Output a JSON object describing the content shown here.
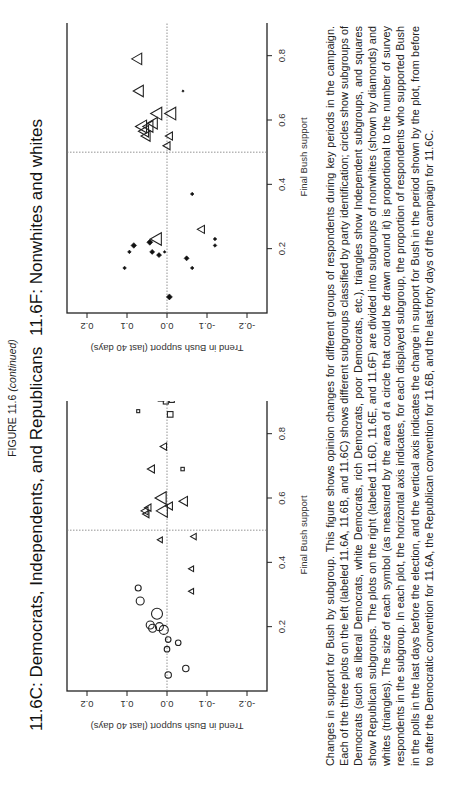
{
  "figure": {
    "label": "FIGURE 11.6",
    "label_suffix": "(continued)"
  },
  "panels": {
    "left": {
      "title": "11.6C:  Democrats, Independents, and Republicans"
    },
    "right": {
      "title": "11.6F:  Nonwhites and whites"
    }
  },
  "axes": {
    "xlabel": "Final Bush support",
    "ylabel": "Trend in Bush support (last 40 days)",
    "x_ticks": [
      "0.2",
      "0.4",
      "0.6",
      "0.8"
    ],
    "y_ticks": [
      "-0.2",
      "-0.1",
      "0.0",
      "0.1",
      "0.2"
    ]
  },
  "caption": "Changes in support for Bush by subgroup. This figure shows opinion changes for different groups of respondents during key periods in the campaign. Each of the three plots on the left (labeled 11.6A, 11.6B, and 11.6C) shows different subgroups classified by party identification; circles show subgroups of Democrats (such as liberal Democrats, white Democrats, rich Democrats, poor Democrats, etc.), triangles show Independent subgroups, and squares show Republican subgroups. The plots on the right (labeled 11.6D, 11.6E, and 11.6F) are divided into subgroups of nonwhites (shown by diamonds) and whites (triangles). The size of each symbol (as measured by the area of a circle that could be drawn around it) is proportional to the number of survey respondents in the subgroup. In each plot, the horizontal axis indicates, for each displayed subgroup, the proportion of respondents who supported Bush in the polls in the last days before the election, and the vertical axis indicates the change in support for Bush in the period shown by the plot, from before to after the Democratic convention for 11.6A, the Republican convention for 11.6B, and the last forty days of the campaign for 11.6C.",
  "chart_data": [
    {
      "type": "scatter",
      "title": "11.6C: Democrats, Independents, and Republicans",
      "xlabel": "Final Bush support",
      "ylabel": "Trend in Bush support (last 40 days)",
      "xlim": [
        0.0,
        0.97
      ],
      "ylim": [
        -0.25,
        0.25
      ],
      "x_ticks": [
        0.2,
        0.4,
        0.6,
        0.8
      ],
      "y_ticks": [
        -0.2,
        -0.1,
        0.0,
        0.1,
        0.2
      ],
      "reference_lines": {
        "x": 0.5,
        "y": 0.0
      },
      "grid": false,
      "series": [
        {
          "name": "Democrats",
          "marker": "circle",
          "points": [
            {
              "x": 0.32,
              "y": 0.072,
              "s": 3
            },
            {
              "x": 0.28,
              "y": 0.067,
              "s": 4
            },
            {
              "x": 0.24,
              "y": 0.025,
              "s": 5.5
            },
            {
              "x": 0.205,
              "y": 0.042,
              "s": 4
            },
            {
              "x": 0.195,
              "y": 0.036,
              "s": 4
            },
            {
              "x": 0.2,
              "y": 0.019,
              "s": 4
            },
            {
              "x": 0.19,
              "y": 0.008,
              "s": 4.5
            },
            {
              "x": 0.16,
              "y": -0.003,
              "s": 2.8
            },
            {
              "x": 0.15,
              "y": -0.028,
              "s": 2.8
            },
            {
              "x": 0.13,
              "y": 0.0,
              "s": 2.8
            },
            {
              "x": 0.05,
              "y": -0.003,
              "s": 3.2
            },
            {
              "x": 0.07,
              "y": -0.047,
              "s": 3.2
            }
          ]
        },
        {
          "name": "Independents",
          "marker": "triangle",
          "points": [
            {
              "x": 0.76,
              "y": 0.008,
              "s": 3.2
            },
            {
              "x": 0.69,
              "y": 0.039,
              "s": 3.5
            },
            {
              "x": 0.6,
              "y": 0.014,
              "s": 5.5
            },
            {
              "x": 0.59,
              "y": -0.042,
              "s": 4.2
            },
            {
              "x": 0.575,
              "y": -0.006,
              "s": 3.5
            },
            {
              "x": 0.56,
              "y": 0.011,
              "s": 5.5
            },
            {
              "x": 0.57,
              "y": 0.047,
              "s": 3.2
            },
            {
              "x": 0.56,
              "y": 0.055,
              "s": 3.5
            },
            {
              "x": 0.55,
              "y": 0.052,
              "s": 3.2
            },
            {
              "x": 0.47,
              "y": 0.017,
              "s": 2.5
            },
            {
              "x": 0.48,
              "y": -0.067,
              "s": 2.8
            },
            {
              "x": 0.38,
              "y": -0.061,
              "s": 2.5
            },
            {
              "x": 0.31,
              "y": -0.061,
              "s": 2.5
            }
          ]
        },
        {
          "name": "Republicans",
          "marker": "square",
          "points": [
            {
              "x": 0.95,
              "y": 0.022,
              "s": 2.5
            },
            {
              "x": 0.94,
              "y": 0.01,
              "s": 2.8
            },
            {
              "x": 0.935,
              "y": -0.01,
              "s": 2.8
            },
            {
              "x": 0.93,
              "y": 0.005,
              "s": 3
            },
            {
              "x": 0.925,
              "y": -0.015,
              "s": 2.8
            },
            {
              "x": 0.92,
              "y": 0.0,
              "s": 3
            },
            {
              "x": 0.915,
              "y": -0.005,
              "s": 3
            },
            {
              "x": 0.91,
              "y": 0.015,
              "s": 2.8
            },
            {
              "x": 0.905,
              "y": -0.012,
              "s": 2.5
            },
            {
              "x": 0.9,
              "y": 0.003,
              "s": 2.5
            },
            {
              "x": 0.87,
              "y": 0.072,
              "s": 1.5
            },
            {
              "x": 0.86,
              "y": -0.008,
              "s": 2.8
            },
            {
              "x": 0.69,
              "y": -0.039,
              "s": 1.7
            }
          ]
        }
      ]
    },
    {
      "type": "scatter",
      "title": "11.6F: Nonwhites and whites",
      "xlabel": "Final Bush support",
      "ylabel": "Trend in Bush support (last 40 days)",
      "xlim": [
        0.0,
        0.97
      ],
      "ylim": [
        -0.25,
        0.25
      ],
      "x_ticks": [
        0.2,
        0.4,
        0.6,
        0.8
      ],
      "y_ticks": [
        -0.2,
        -0.1,
        0.0,
        0.1,
        0.2
      ],
      "reference_lines": {
        "x": 0.5,
        "y": 0.0
      },
      "grid": false,
      "series": [
        {
          "name": "Whites",
          "marker": "triangle",
          "points": [
            {
              "x": 0.93,
              "y": 0.01,
              "s": 5
            },
            {
              "x": 0.79,
              "y": 0.074,
              "s": 5
            },
            {
              "x": 0.69,
              "y": 0.07,
              "s": 5
            },
            {
              "x": 0.62,
              "y": 0.025,
              "s": 5.5
            },
            {
              "x": 0.62,
              "y": -0.01,
              "s": 5.5
            },
            {
              "x": 0.59,
              "y": 0.035,
              "s": 5
            },
            {
              "x": 0.58,
              "y": 0.046,
              "s": 5
            },
            {
              "x": 0.58,
              "y": 0.063,
              "s": 5.5
            },
            {
              "x": 0.565,
              "y": 0.057,
              "s": 5
            },
            {
              "x": 0.55,
              "y": 0.052,
              "s": 4.5
            },
            {
              "x": 0.55,
              "y": -0.006,
              "s": 3.5
            },
            {
              "x": 0.52,
              "y": 0.0,
              "s": 3.5
            },
            {
              "x": 0.23,
              "y": 0.026,
              "s": 5.5
            },
            {
              "x": 0.26,
              "y": -0.086,
              "s": 3.5
            }
          ]
        },
        {
          "name": "Nonwhites",
          "marker": "diamond",
          "points": [
            {
              "x": 0.69,
              "y": -0.04,
              "s": 1.2
            },
            {
              "x": 0.37,
              "y": -0.063,
              "s": 1.8
            },
            {
              "x": 0.22,
              "y": 0.043,
              "s": 3
            },
            {
              "x": 0.21,
              "y": 0.083,
              "s": 2.8
            },
            {
              "x": 0.19,
              "y": 0.094,
              "s": 1.8
            },
            {
              "x": 0.19,
              "y": 0.037,
              "s": 2.5
            },
            {
              "x": 0.18,
              "y": 0.02,
              "s": 2.5
            },
            {
              "x": 0.19,
              "y": 0.006,
              "s": 1.4
            },
            {
              "x": 0.17,
              "y": -0.049,
              "s": 2.5
            },
            {
              "x": 0.14,
              "y": 0.106,
              "s": 1.8
            },
            {
              "x": 0.14,
              "y": -0.063,
              "s": 1.8
            },
            {
              "x": 0.23,
              "y": -0.12,
              "s": 1.8
            },
            {
              "x": 0.21,
              "y": -0.12,
              "s": 1.8
            },
            {
              "x": 0.05,
              "y": -0.006,
              "s": 3
            }
          ]
        }
      ]
    }
  ]
}
